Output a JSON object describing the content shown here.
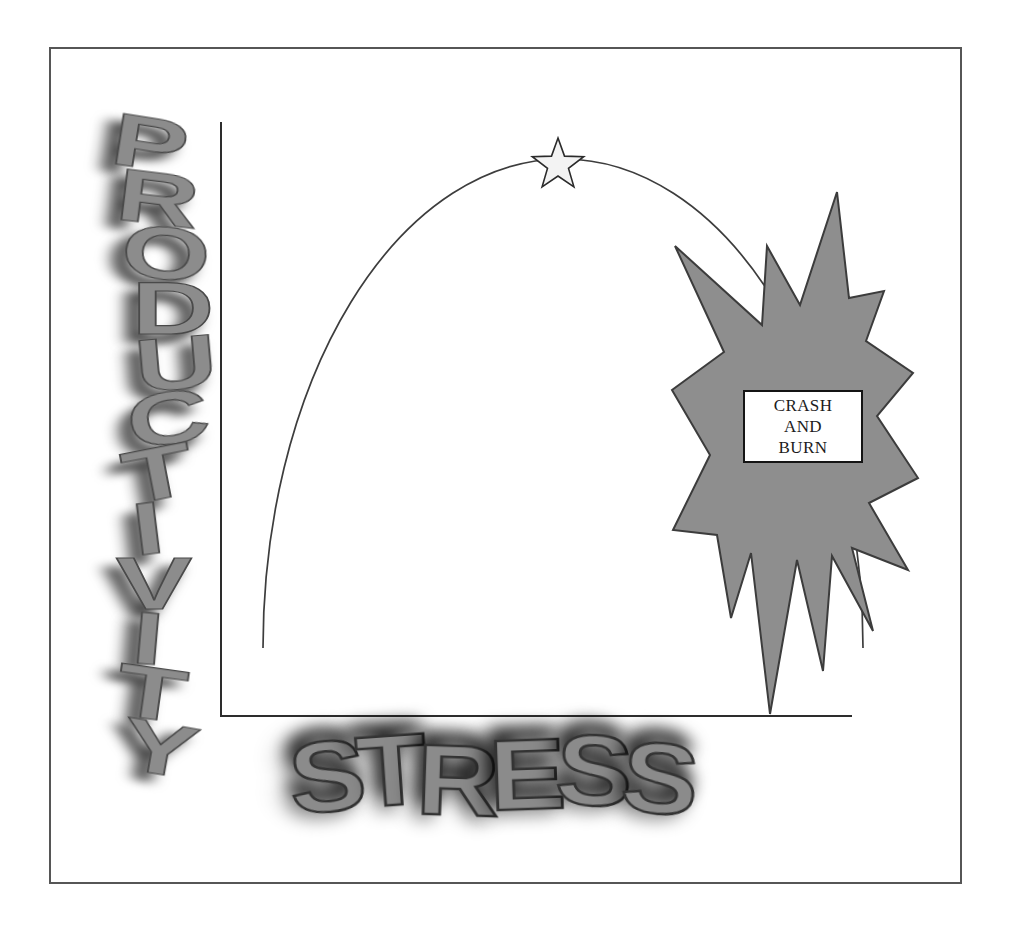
{
  "figure": {
    "y_axis_label": "PRODUCTIVITY",
    "x_axis_label": "STRESS",
    "peak_marker_icon": "star-icon",
    "annotation_box": {
      "lines": [
        "CRASH",
        "AND",
        "BURN"
      ]
    },
    "colors": {
      "wordart_gray": "#8c8c8c",
      "starburst_gray": "#8e8e8e",
      "curve_line": "#3d3d3d",
      "axis_line": "#2d2d2d",
      "outer_border": "#565656",
      "star_fill": "#f3f3f3",
      "annotation_box_bg": "#ffffff",
      "annotation_box_border": "#141414"
    }
  },
  "chart_data": {
    "type": "line",
    "title": "",
    "xlabel": "STRESS",
    "ylabel": "PRODUCTIVITY",
    "grid": false,
    "legend": false,
    "axis_tick_labels": "none",
    "x_normalized": [
      0,
      0.1,
      0.2,
      0.3,
      0.4,
      0.5,
      0.6,
      0.7,
      0.8,
      0.9,
      1.0
    ],
    "y_normalized": [
      0.12,
      0.42,
      0.65,
      0.82,
      0.94,
      1.0,
      0.94,
      0.82,
      0.65,
      0.42,
      0.12
    ],
    "annotations": [
      {
        "label": "star-marker",
        "x_normalized": 0.49,
        "y_normalized": 1.0
      },
      {
        "label": "CRASH AND BURN",
        "x_normalized": 0.89,
        "y_normalized": 0.5
      }
    ]
  }
}
